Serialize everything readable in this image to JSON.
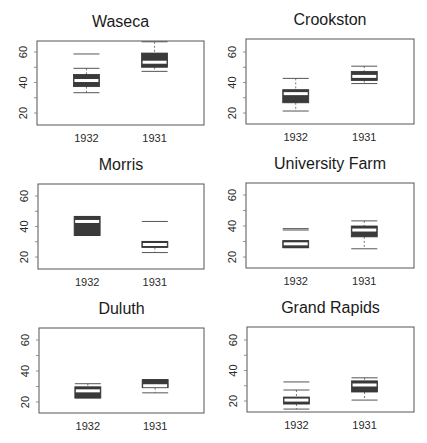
{
  "chart_data": {
    "type": "boxplot",
    "layout": {
      "rows": 3,
      "cols": 2
    },
    "colors": {
      "box_fill": "#3a3a3a",
      "median": "#ffffff",
      "frame": "#555555",
      "whisker": "#555555"
    },
    "ylim": [
      13,
      70
    ],
    "yticks": [
      20,
      40,
      60
    ],
    "panels": [
      {
        "title": "Waseca",
        "categories": [
          "1932",
          "1931"
        ],
        "boxes": [
          {
            "label": "1932",
            "whisker_low": 33.3,
            "q1": 37.3,
            "median": 41.3,
            "q3": 45.3,
            "whisker_high": 49.3,
            "outliers": [
              58.7
            ]
          },
          {
            "label": "1931",
            "whisker_low": 47.3,
            "q1": 50.0,
            "median": 53.3,
            "q3": 59.3,
            "whisker_high": 66.7,
            "outliers": []
          }
        ]
      },
      {
        "title": "Crookston",
        "categories": [
          "1932",
          "1931"
        ],
        "boxes": [
          {
            "label": "1932",
            "whisker_low": 21.3,
            "q1": 26.7,
            "median": 32.7,
            "q3": 35.3,
            "whisker_high": 42.7,
            "outliers": []
          },
          {
            "label": "1931",
            "whisker_low": 39.3,
            "q1": 41.3,
            "median": 44.0,
            "q3": 47.3,
            "whisker_high": 50.7,
            "outliers": []
          }
        ]
      },
      {
        "title": "Morris",
        "categories": [
          "1932",
          "1931"
        ],
        "boxes": [
          {
            "label": "1932",
            "whisker_low": 34.1,
            "q1": 34.1,
            "median": 43.3,
            "q3": 46.6,
            "whisker_high": 46.6,
            "outliers": []
          },
          {
            "label": "1931",
            "whisker_low": 22.9,
            "q1": 26.2,
            "median": 28.2,
            "q3": 30.2,
            "whisker_high": 30.2,
            "outliers": [
              43.3
            ]
          }
        ]
      },
      {
        "title": "University Farm",
        "categories": [
          "1932",
          "1931"
        ],
        "boxes": [
          {
            "label": "1932",
            "whisker_low": 26.0,
            "q1": 26.0,
            "median": 28.5,
            "q3": 30.5,
            "whisker_high": 30.5,
            "outliers": [
              37.4,
              38.3
            ]
          },
          {
            "label": "1931",
            "whisker_low": 25.3,
            "q1": 33.0,
            "median": 37.4,
            "q3": 40.0,
            "whisker_high": 43.3,
            "outliers": []
          }
        ]
      },
      {
        "title": "Duluth",
        "categories": [
          "1932",
          "1931"
        ],
        "boxes": [
          {
            "label": "1932",
            "whisker_low": 22.6,
            "q1": 22.6,
            "median": 27.2,
            "q3": 29.8,
            "whisker_high": 31.8,
            "outliers": []
          },
          {
            "label": "1931",
            "whisker_low": 25.9,
            "q1": 29.2,
            "median": 30.5,
            "q3": 34.4,
            "whisker_high": 34.4,
            "outliers": []
          }
        ]
      },
      {
        "title": "Grand Rapids",
        "categories": [
          "1932",
          "1931"
        ],
        "boxes": [
          {
            "label": "1932",
            "whisker_low": 14.7,
            "q1": 18.0,
            "median": 20.6,
            "q3": 22.6,
            "whisker_high": 27.2,
            "outliers": [
              32.5
            ]
          },
          {
            "label": "1931",
            "whisker_low": 20.6,
            "q1": 25.9,
            "median": 30.5,
            "q3": 33.2,
            "whisker_high": 35.2,
            "outliers": []
          }
        ]
      }
    ]
  }
}
